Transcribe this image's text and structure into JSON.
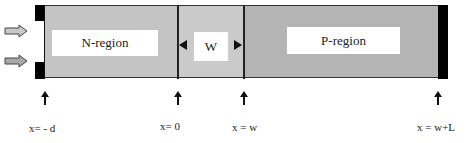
{
  "diagram": {
    "regions": [
      {
        "id": "n",
        "label": "N-region",
        "color": "#c4c4c4"
      },
      {
        "id": "w",
        "label": "W",
        "color": "#cacaca"
      },
      {
        "id": "p",
        "label": "P-region",
        "color": "#b4b4b4"
      }
    ],
    "contact_color": "#000000",
    "incident_arrows": 2,
    "positions": [
      {
        "label": "x= - d"
      },
      {
        "label": "x= 0"
      },
      {
        "label": "x = w"
      },
      {
        "label": "x = w+L"
      }
    ]
  }
}
